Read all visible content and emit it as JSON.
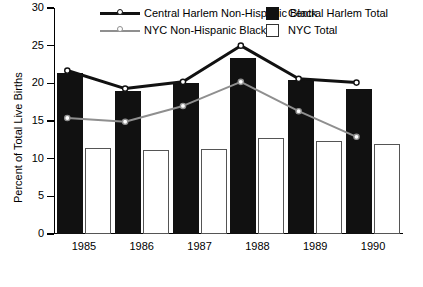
{
  "chart_data": {
    "type": "bar",
    "title": "",
    "xlabel": "",
    "ylabel": "Percent of Total Live Births",
    "categories": [
      "1985",
      "1986",
      "1987",
      "1988",
      "1989",
      "1990"
    ],
    "ylim": [
      0,
      30
    ],
    "yticks": [
      0,
      5,
      10,
      15,
      20,
      25,
      30
    ],
    "grid": false,
    "legend_position": "top",
    "series": [
      {
        "name": "Central Harlem Total",
        "kind": "bar",
        "color": "#111111",
        "values": [
          21.4,
          19.0,
          20.0,
          23.4,
          20.4,
          19.2
        ]
      },
      {
        "name": "NYC Total",
        "kind": "bar",
        "color": "#ffffff",
        "values": [
          11.4,
          11.1,
          11.3,
          12.8,
          12.4,
          12.0
        ]
      },
      {
        "name": "Central Harlem Non-Hispanic Black",
        "kind": "line",
        "color": "#111111",
        "values": [
          21.7,
          19.3,
          20.2,
          25.0,
          20.6,
          20.1
        ]
      },
      {
        "name": "NYC  Non-Hispanic Black",
        "kind": "line",
        "color": "#8f8f8f",
        "values": [
          15.4,
          14.9,
          17.0,
          20.2,
          16.3,
          12.9
        ]
      }
    ]
  },
  "legend": {
    "items": [
      {
        "label": "Central Harlem Non-Hispanic Black",
        "marker": "line-dark"
      },
      {
        "label": "Central Harlem Total",
        "marker": "swatch-dark"
      },
      {
        "label": "NYC  Non-Hispanic Black",
        "marker": "line-gray"
      },
      {
        "label": "NYC Total",
        "marker": "swatch-light"
      }
    ]
  }
}
